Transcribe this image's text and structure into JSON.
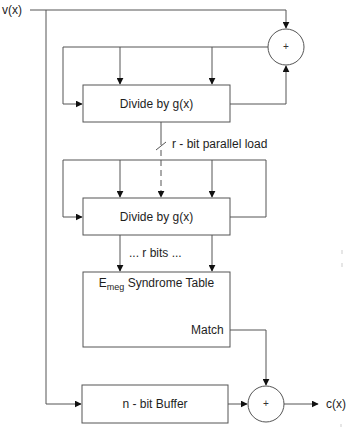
{
  "diagram": {
    "input_label": "v(x)",
    "output_label": "c(x)",
    "blocks": {
      "divider_1": {
        "label": "Divide by g(x)"
      },
      "divider_2": {
        "label": "Divide by g(x)"
      },
      "syndrome_table": {
        "label_main": "E",
        "label_sub": "meg",
        "label_rest": " Syndrome Table",
        "output_label": "Match"
      },
      "buffer": {
        "label": "n - bit Buffer"
      }
    },
    "adders": {
      "top": {
        "symbol": "+"
      },
      "bottom": {
        "symbol": "+"
      }
    },
    "annotations": {
      "parallel_load": "r - bit parallel load",
      "r_bits": "...  r bits  ..."
    },
    "colors": {
      "line": "#555555",
      "text": "#1e1e1e",
      "background": "#ffffff"
    }
  }
}
